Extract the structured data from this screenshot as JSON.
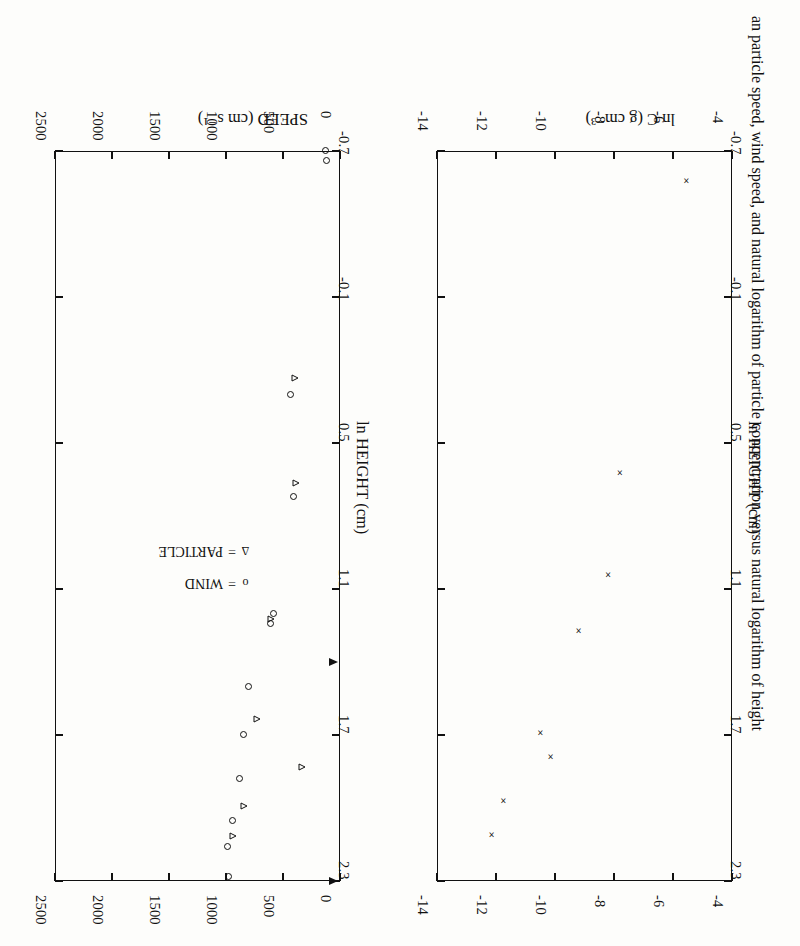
{
  "page": {
    "rotation_deg": 180,
    "background": "#fdfdfb",
    "ink": "#111111"
  },
  "caption": {
    "text": "an particle speed, wind speed, and natural logarithm of particle concentration versus natural logarithm of height",
    "orientation": "vertical-right-edge"
  },
  "legend": {
    "items": [
      {
        "symbol": "o",
        "separator": "=",
        "label": "WIND"
      },
      {
        "symbol": "Δ",
        "separator": "=",
        "label": "PARTICLE"
      }
    ]
  },
  "chart_data": [
    {
      "id": "speed-panel",
      "type": "scatter",
      "title": "",
      "xlabel": "SPEED (cm s⁻¹)",
      "ylabel": "ln HEIGHT (cm)",
      "xlim": [
        0,
        2500
      ],
      "ylim": [
        -0.7,
        2.3
      ],
      "xticks": [
        0,
        500,
        1000,
        1500,
        2000,
        2500
      ],
      "xticklabels": [
        "0",
        "500",
        "1000",
        "1500",
        "2000",
        "2500"
      ],
      "yticks": [
        -0.7,
        -0.1,
        0.5,
        1.1,
        1.7,
        2.3
      ],
      "yticklabels": [
        "-0.7",
        "-0.1",
        "0.5",
        "1.1",
        "1.7",
        "2.3"
      ],
      "grid": false,
      "ticks_both_sides": true,
      "legend_position": "center-right",
      "axis_arrows": {
        "axis": "x",
        "at": [
          2.3,
          1.4
        ],
        "note": "arrow heads on left spine axis"
      },
      "series": [
        {
          "name": "WIND",
          "marker": "circle-open",
          "points": [
            {
              "x": 975,
              "y": 2.28
            },
            {
              "x": 985,
              "y": 2.16
            },
            {
              "x": 940,
              "y": 2.05
            },
            {
              "x": 880,
              "y": 1.88
            },
            {
              "x": 845,
              "y": 1.7
            },
            {
              "x": 800,
              "y": 1.5
            },
            {
              "x": 610,
              "y": 1.24
            },
            {
              "x": 585,
              "y": 1.2
            },
            {
              "x": 405,
              "y": 0.72
            },
            {
              "x": 430,
              "y": 0.3
            },
            {
              "x": 120,
              "y": -0.66
            },
            {
              "x": 130,
              "y": -0.7
            }
          ]
        },
        {
          "name": "PARTICLE",
          "marker": "triangle-open",
          "points": [
            {
              "x": 930,
              "y": 2.14
            },
            {
              "x": 840,
              "y": 2.02
            },
            {
              "x": 720,
              "y": 1.66
            },
            {
              "x": 600,
              "y": 1.25
            },
            {
              "x": 380,
              "y": 0.69
            },
            {
              "x": 390,
              "y": 0.26
            },
            {
              "x": 330,
              "y": 1.86
            }
          ]
        }
      ]
    },
    {
      "id": "concentration-panel",
      "type": "scatter",
      "title": "",
      "xlabel": "ln C (g cm⁻³)",
      "ylabel": "ln HEIGHT (cm)",
      "xlim": [
        -4,
        -14
      ],
      "ylim": [
        -0.7,
        2.3
      ],
      "xticks": [
        -4,
        -6,
        -8,
        -10,
        -12,
        -14
      ],
      "xticklabels": [
        "-4",
        "-6",
        "-8",
        "-10",
        "-12",
        "-14"
      ],
      "yticks": [
        -0.7,
        -0.1,
        0.5,
        1.1,
        1.7,
        2.3
      ],
      "yticklabels": [
        "-0.7",
        "-0.1",
        "0.5",
        "1.1",
        "1.7",
        "2.3"
      ],
      "grid": false,
      "ticks_both_sides": true,
      "series": [
        {
          "name": "concentration",
          "marker": "x",
          "points": [
            {
              "x": -12.15,
              "y": 2.11
            },
            {
              "x": -11.75,
              "y": 1.97
            },
            {
              "x": -10.15,
              "y": 1.79
            },
            {
              "x": -10.5,
              "y": 1.69
            },
            {
              "x": -9.2,
              "y": 1.27
            },
            {
              "x": -8.2,
              "y": 1.04
            },
            {
              "x": -7.8,
              "y": 0.62
            },
            {
              "x": -5.55,
              "y": -0.58
            }
          ]
        }
      ]
    }
  ]
}
